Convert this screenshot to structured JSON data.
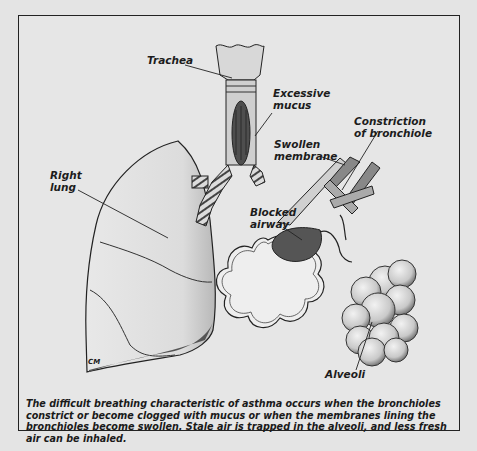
{
  "figure": {
    "labels": {
      "trachea": "Trachea",
      "excessive_mucus": "Excessive\nmucus",
      "constriction": "Constriction\nof bronchiole",
      "swollen_membrane": "Swollen\nmembrane",
      "right_lung": "Right\nlung",
      "blocked_airway": "Blocked\nairway",
      "alveoli": "Alveoli"
    },
    "signature": "CM",
    "caption": "The difficult breathing characteristic of asthma occurs when the bronchioles constrict or become clogged with mucus or when the membranes lining the bronchioles become swollen. Stale air is trapped in the alveoli, and less fresh air can be inhaled."
  },
  "colors": {
    "background": "#e4e4e4",
    "ink": "#1c1c1c",
    "mucus": "#555555",
    "blocked": "#5a5a5a"
  }
}
